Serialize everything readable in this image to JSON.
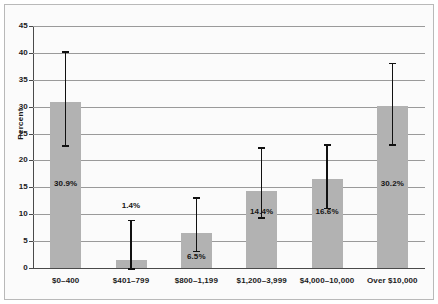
{
  "chart_data": {
    "type": "bar",
    "title": "",
    "xlabel": "",
    "ylabel": "Percent",
    "ylim": [
      0,
      45
    ],
    "ytick_step": 5,
    "yticks": [
      "0",
      "5",
      "10",
      "15",
      "20",
      "25",
      "30",
      "35",
      "40",
      "45"
    ],
    "grid": true,
    "legend": "none",
    "categories": [
      "$0–400",
      "$401–799",
      "$800–1,199",
      "$1,200–3,999",
      "$4,000–10,000",
      "Over $10,000"
    ],
    "values": [
      30.9,
      1.4,
      6.5,
      14.4,
      16.6,
      30.2
    ],
    "value_labels": [
      "30.9%",
      "1.4%",
      "6.5%",
      "14.4%",
      "16.6%",
      "30.2%"
    ],
    "error_bars": [
      {
        "low": 22.8,
        "high": 40.3
      },
      {
        "low": 0.0,
        "high": 9.0
      },
      {
        "low": 3.2,
        "high": 13.2
      },
      {
        "low": 9.4,
        "high": 22.5
      },
      {
        "low": 11.2,
        "high": 23.0
      },
      {
        "low": 23.0,
        "high": 38.2
      }
    ],
    "colors": {
      "bar_fill": "#b2b2b2",
      "error_bar": "#111111",
      "gridline": "#9a9a9a",
      "axis": "#4a4a4a",
      "plot_background": "#fbfbfb",
      "text": "#1a1a1a"
    }
  }
}
